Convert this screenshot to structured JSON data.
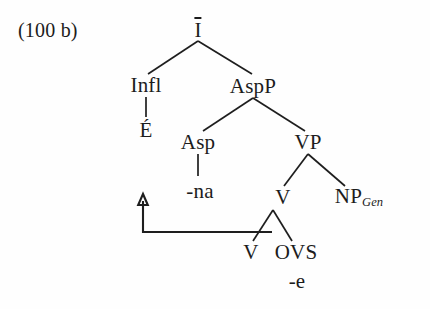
{
  "figure": {
    "example_label": "(100 b)",
    "caption": ""
  },
  "tree": {
    "nodes": {
      "root": {
        "label": "I",
        "note": "I-bar, rendered with overbar"
      },
      "infl": {
        "label": "Infl"
      },
      "aspp": {
        "label": "AspP"
      },
      "infl_lex": {
        "label": "É"
      },
      "asp": {
        "label": "Asp"
      },
      "vp": {
        "label": "VP"
      },
      "asp_lex": {
        "label": "-na"
      },
      "v_upper": {
        "label": "V"
      },
      "np": {
        "label": "NP",
        "subscript": "Gen"
      },
      "v_lower": {
        "label": "V"
      },
      "ovs": {
        "label": "OVS"
      },
      "ovs_suffix": {
        "label": "-e"
      }
    },
    "movement": {
      "from": "v_lower",
      "to": "asp_lex",
      "arrowhead": "up"
    }
  },
  "colors": {
    "background": "#fefefe",
    "ink": "#1c1c1c",
    "edge": "#1e1e1e"
  }
}
